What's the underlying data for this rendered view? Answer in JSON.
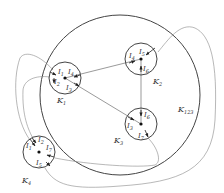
{
  "diagram": {
    "type": "graph-of-nested-circles",
    "colors": {
      "stroke": "#444444",
      "thin_stroke": "#888888",
      "text": "#333333",
      "background": "#ffffff"
    },
    "outer_region": {
      "label": "K",
      "label_sub": "123"
    },
    "nodes": [
      {
        "id": "K1",
        "label": "K",
        "label_sub": "1",
        "ports": [
          "I",
          "I",
          "I",
          "I"
        ],
        "port_subs": [
          "1",
          "4",
          "2",
          "3"
        ]
      },
      {
        "id": "K2",
        "label": "K",
        "label_sub": "2",
        "ports": [
          "I",
          "I",
          "I"
        ],
        "port_subs": [
          "4",
          "5",
          "6"
        ]
      },
      {
        "id": "K3",
        "label": "K",
        "label_sub": "3",
        "ports": [
          "I",
          "I",
          "I"
        ],
        "port_subs": [
          "6",
          "3",
          "7"
        ]
      },
      {
        "id": "K4",
        "label": "K",
        "label_sub": "4",
        "ports": [
          "I",
          "I",
          "I",
          "I"
        ],
        "port_subs": [
          "1",
          "2",
          "7",
          "5"
        ]
      }
    ],
    "edges": [
      {
        "from": "K1",
        "to": "K2",
        "via": "I4"
      },
      {
        "from": "K1",
        "to": "K3",
        "via": "I3"
      },
      {
        "from": "K2",
        "to": "K3",
        "via": "I6"
      },
      {
        "from": "K4",
        "to": "K1",
        "via": "I1"
      },
      {
        "from": "K4",
        "to": "K1",
        "via": "I2"
      },
      {
        "from": "K4",
        "to": "K3",
        "via": "I7"
      },
      {
        "from": "K4",
        "to": "K2",
        "via": "I5"
      }
    ]
  }
}
